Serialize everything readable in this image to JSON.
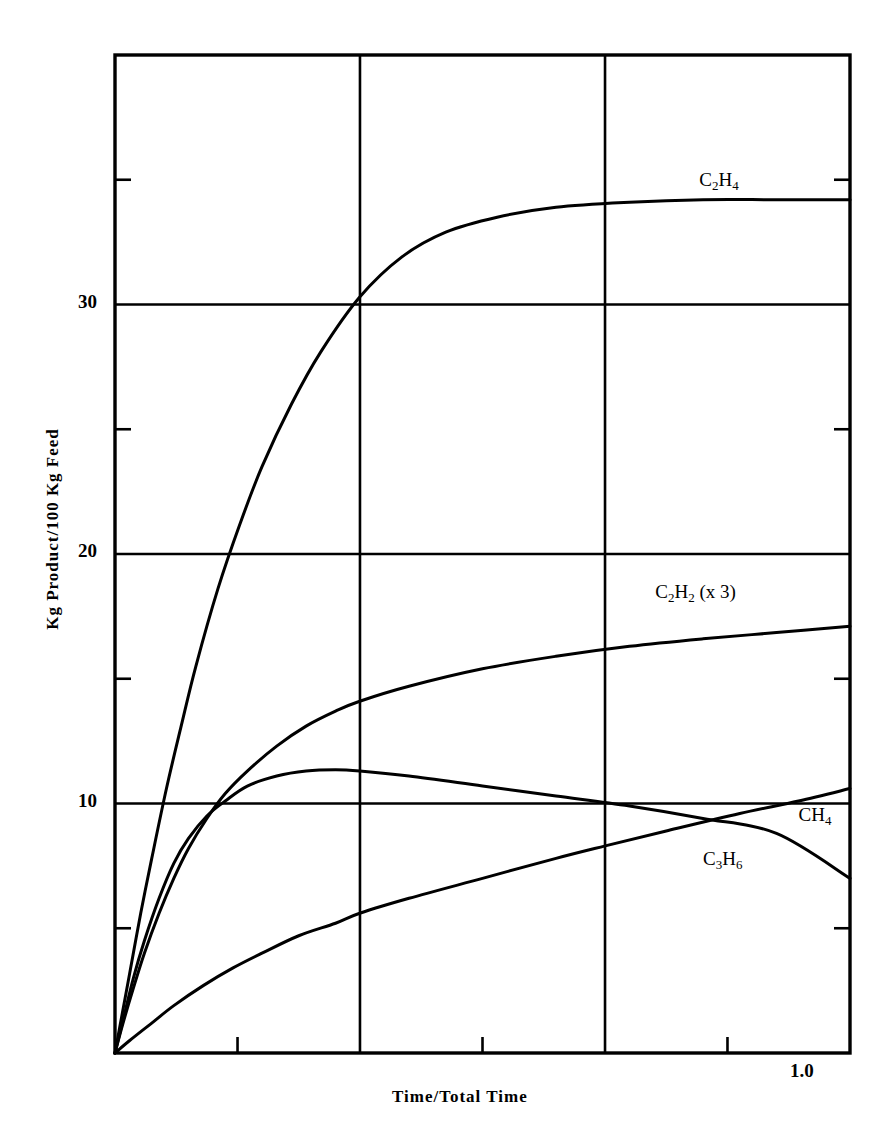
{
  "chart_data": {
    "type": "line",
    "title": "",
    "subtitle": "",
    "xlabel": "Time/Total Time",
    "ylabel": "Kg Product/100 Kg Feed",
    "xlim": [
      0.0,
      1.0
    ],
    "ylim": [
      0.0,
      40.0
    ],
    "grid": true,
    "grid_x_values": [
      0.0,
      0.3333,
      0.6667,
      1.0
    ],
    "grid_y_values": [
      10,
      20,
      30
    ],
    "x_tick_labels": [
      "1.0"
    ],
    "x_tick_label_values": [
      1.0
    ],
    "x_minor_ticks": [
      0.1667,
      0.5,
      0.8333
    ],
    "y_tick_labels": [
      "10",
      "20",
      "30"
    ],
    "y_tick_label_values": [
      10,
      20,
      30
    ],
    "y_minor_ticks": [
      5,
      15,
      25,
      35
    ],
    "legend_position": "inline-annotations",
    "line_color": "#000000",
    "background_color": "#ffffff",
    "series": [
      {
        "name": "C2H4",
        "label_text": "C",
        "label_parts": [
          "C",
          "2",
          "H",
          "4"
        ],
        "label_x": 0.795,
        "label_y": 34.9,
        "points": [
          [
            0.0,
            0.0
          ],
          [
            0.01,
            1.6
          ],
          [
            0.02,
            3.2
          ],
          [
            0.035,
            5.6
          ],
          [
            0.05,
            7.8
          ],
          [
            0.07,
            10.6
          ],
          [
            0.09,
            13.1
          ],
          [
            0.11,
            15.5
          ],
          [
            0.14,
            18.6
          ],
          [
            0.17,
            21.2
          ],
          [
            0.2,
            23.5
          ],
          [
            0.24,
            26.0
          ],
          [
            0.28,
            28.1
          ],
          [
            0.333,
            30.3
          ],
          [
            0.39,
            31.9
          ],
          [
            0.45,
            32.9
          ],
          [
            0.52,
            33.5
          ],
          [
            0.6,
            33.9
          ],
          [
            0.7,
            34.1
          ],
          [
            0.8,
            34.2
          ],
          [
            0.9,
            34.2
          ],
          [
            1.0,
            34.2
          ]
        ]
      },
      {
        "name": "C2H2 (x 3)",
        "label_text": "C",
        "label_parts": [
          "C",
          "2",
          "H",
          "2",
          " (x 3)"
        ],
        "label_x": 0.735,
        "label_y": 18.4,
        "points": [
          [
            0.0,
            0.0
          ],
          [
            0.01,
            1.1
          ],
          [
            0.025,
            2.6
          ],
          [
            0.04,
            4.0
          ],
          [
            0.06,
            5.6
          ],
          [
            0.08,
            7.0
          ],
          [
            0.1,
            8.2
          ],
          [
            0.125,
            9.4
          ],
          [
            0.15,
            10.4
          ],
          [
            0.18,
            11.3
          ],
          [
            0.22,
            12.3
          ],
          [
            0.26,
            13.1
          ],
          [
            0.3,
            13.7
          ],
          [
            0.333,
            14.1
          ],
          [
            0.4,
            14.7
          ],
          [
            0.5,
            15.4
          ],
          [
            0.6,
            15.9
          ],
          [
            0.7,
            16.3
          ],
          [
            0.8,
            16.6
          ],
          [
            0.9,
            16.85
          ],
          [
            1.0,
            17.1
          ]
        ]
      },
      {
        "name": "CH4",
        "label_text": "CH",
        "label_parts": [
          "CH",
          "4"
        ],
        "label_x": 0.93,
        "label_y": 9.45,
        "points": [
          [
            0.0,
            0.0
          ],
          [
            0.01,
            1.2
          ],
          [
            0.025,
            3.0
          ],
          [
            0.04,
            4.5
          ],
          [
            0.06,
            6.2
          ],
          [
            0.08,
            7.6
          ],
          [
            0.1,
            8.6
          ],
          [
            0.125,
            9.5
          ],
          [
            0.15,
            10.1
          ],
          [
            0.18,
            10.7
          ],
          [
            0.22,
            11.1
          ],
          [
            0.26,
            11.3
          ],
          [
            0.3,
            11.35
          ],
          [
            0.333,
            11.3
          ],
          [
            0.4,
            11.1
          ],
          [
            0.5,
            10.7
          ],
          [
            0.6,
            10.3
          ],
          [
            0.7,
            9.9
          ],
          [
            0.8,
            9.4
          ],
          [
            0.9,
            8.8
          ],
          [
            1.0,
            7.0
          ]
        ]
      },
      {
        "name": "C3H6",
        "label_text": "C",
        "label_parts": [
          "C",
          "3",
          "H",
          "6"
        ],
        "label_x": 0.8,
        "label_y": 7.7,
        "points": [
          [
            0.0,
            0.0
          ],
          [
            0.02,
            0.5
          ],
          [
            0.05,
            1.2
          ],
          [
            0.08,
            1.9
          ],
          [
            0.12,
            2.7
          ],
          [
            0.16,
            3.4
          ],
          [
            0.2,
            4.0
          ],
          [
            0.25,
            4.7
          ],
          [
            0.3,
            5.2
          ],
          [
            0.333,
            5.6
          ],
          [
            0.4,
            6.2
          ],
          [
            0.5,
            7.0
          ],
          [
            0.6,
            7.8
          ],
          [
            0.667,
            8.3
          ],
          [
            0.75,
            8.9
          ],
          [
            0.85,
            9.6
          ],
          [
            0.93,
            10.1
          ],
          [
            1.0,
            10.6
          ]
        ]
      }
    ]
  },
  "plot": {
    "box_left_px": 115,
    "box_right_px": 850,
    "box_top_px": 55,
    "box_bottom_px": 1053
  },
  "labels": {
    "y_axis_title": "Kg Product/100 Kg Feed",
    "x_axis_title": "Time/Total Time",
    "x_max_tick": "1.0",
    "y_tick_10": "10",
    "y_tick_20": "20",
    "y_tick_30": "30"
  },
  "series_labels": {
    "c2h4": {
      "base1": "C",
      "sub1": "2",
      "base2": "H",
      "sub2": "4",
      "suffix": ""
    },
    "c2h2": {
      "base1": "C",
      "sub1": "2",
      "base2": "H",
      "sub2": "2",
      "suffix": " (x 3)"
    },
    "ch4": {
      "base1": "CH",
      "sub1": "4",
      "base2": "",
      "sub2": "",
      "suffix": ""
    },
    "c3h6": {
      "base1": "C",
      "sub1": "3",
      "base2": "H",
      "sub2": "6",
      "suffix": ""
    }
  }
}
